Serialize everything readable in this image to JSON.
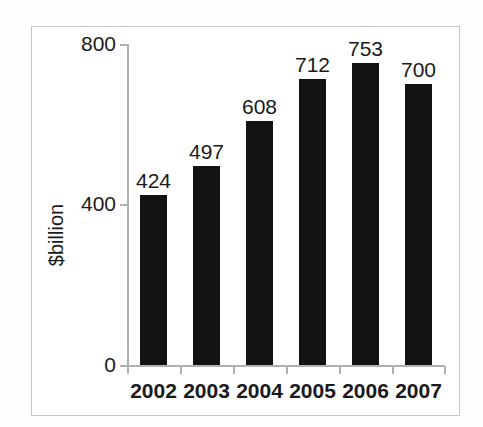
{
  "chart_data": {
    "type": "bar",
    "title": "",
    "subtitle": "",
    "xlabel": "",
    "ylabel": "$billion",
    "categories": [
      "2002",
      "2003",
      "2004",
      "2005",
      "2006",
      "2007"
    ],
    "values": [
      424,
      497,
      608,
      712,
      753,
      700
    ],
    "value_labels": [
      "424",
      "497",
      "608",
      "712",
      "753",
      "700"
    ],
    "ylim": [
      0,
      800
    ],
    "y_ticks": [
      0,
      400,
      800
    ],
    "y_tick_labels": [
      "0",
      "400",
      "800"
    ],
    "grid": false,
    "legend": null,
    "legend_position": "none",
    "bar_color": "#121212",
    "axis_color": "#b0b0b0",
    "text_color": "#1a1a1a",
    "background_color": "#ffffff",
    "frame_color": "#c6c6c6"
  }
}
